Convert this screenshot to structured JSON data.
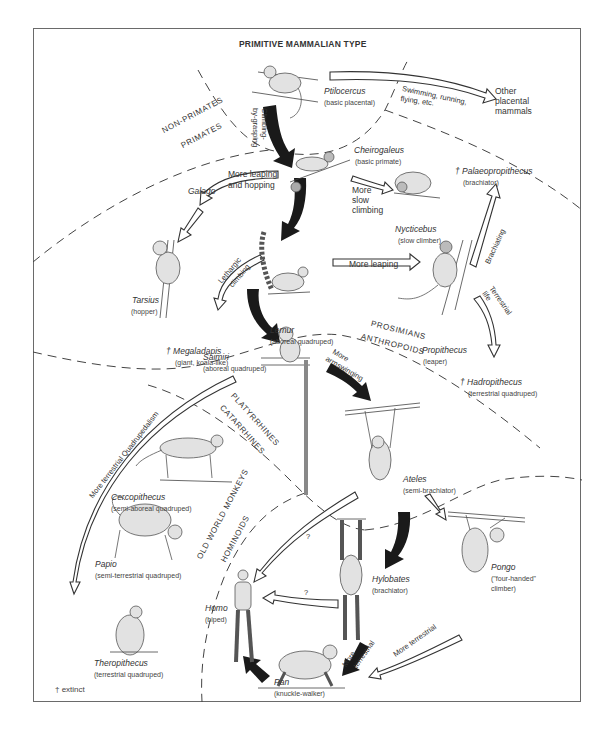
{
  "title": "PRIMITIVE MAMMALIAN TYPE",
  "footnote": "† extinct",
  "zones": {
    "non_primates": "NON-PRIMATES",
    "primates": "PRIMATES",
    "prosimians": "PROSIMIANS",
    "anthropoids": "ANTHROPOIDS",
    "platyrrhines": "PLATYRRHINES",
    "catarrhines": "CATARRHINES",
    "old_world_monkeys": "OLD WORLD MONKEYS",
    "hominoids": "HOMINOIDS"
  },
  "taxa": {
    "ptilocercus": {
      "genus": "Ptilocercus",
      "desc": "(basic placental)"
    },
    "other_placentals": {
      "line1": "Other",
      "line2": "placental",
      "line3": "mammals"
    },
    "cheirogaleus": {
      "genus": "Cheirogaleus",
      "desc": "(basic primate)"
    },
    "galago": {
      "genus": "Galago"
    },
    "nycticebus": {
      "genus": "Nycticebus",
      "desc": "(slow climber)"
    },
    "palaeopropithecus": {
      "genus": "† Palaeopropithecus",
      "desc": "(brachiator)"
    },
    "tarsius": {
      "genus": "Tarsius",
      "desc": "(hopper)"
    },
    "lemur": {
      "genus": "Lemur",
      "desc": "(aboreal quadruped)"
    },
    "megaladapis": {
      "genus": "† Megaladapis",
      "desc": "(giant, koala-like)"
    },
    "propithecus": {
      "genus": "Propithecus",
      "desc": "(leaper)"
    },
    "hadropithecus": {
      "genus": "† Hadropithecus",
      "desc": "(terrestrial quadruped)"
    },
    "saimiri": {
      "genus": "Saimiri",
      "desc": "(aboreal quadruped)"
    },
    "cercopithecus": {
      "genus": "Cercopithecus",
      "desc": "(semi-aboreal quadruped)"
    },
    "ateles": {
      "genus": "Ateles",
      "desc": "(semi-brachiator)"
    },
    "papio": {
      "genus": "Papio",
      "desc": "(semi-terrestrial quadruped)"
    },
    "theropithecus": {
      "genus": "Theropithecus",
      "desc": "(terrestrial quadruped)"
    },
    "homo": {
      "genus": "Homo",
      "desc": "(biped)"
    },
    "hylobates": {
      "genus": "Hylobates",
      "desc": "(brachiator)"
    },
    "pongo": {
      "genus": "Pongo",
      "desc1": "(\"four-handed\"",
      "desc2": "climber)"
    },
    "pan": {
      "genus": "Pan",
      "desc": "(knuckle-walker)"
    }
  },
  "arrows": {
    "swimming": {
      "line1": "Swimming, running,",
      "line2": "flying, etc."
    },
    "climbing": {
      "line1": "Climbing-",
      "line2": "by-grasping"
    },
    "more_leaping_hopping": {
      "line1": "More leaping",
      "line2": "and hopping"
    },
    "more_slow_climbing": {
      "line1": "More",
      "line2": "slow",
      "line3": "climbing"
    },
    "brachiating": "Brachiating",
    "lethargic": {
      "line1": "Lethargic",
      "line2": "climbing"
    },
    "more_leaping": "More leaping",
    "terrestrial_life": {
      "line1": "Terrestrial",
      "line2": "life"
    },
    "more_armswinging": {
      "line1": "More",
      "line2": "armswinging"
    },
    "terrestrial_quadrupedalism": "More terrestrial Quadrupedalism",
    "question1": "?",
    "question2": "?",
    "more_terrestrial_black": {
      "line1": "More",
      "line2": "terrestrial"
    },
    "more_terrestrial_open": "More terrestrial"
  },
  "colors": {
    "ink": "#2a2a2a",
    "frame": "#6a6a6a",
    "fur": "#d8d8d8",
    "background": "#ffffff"
  }
}
